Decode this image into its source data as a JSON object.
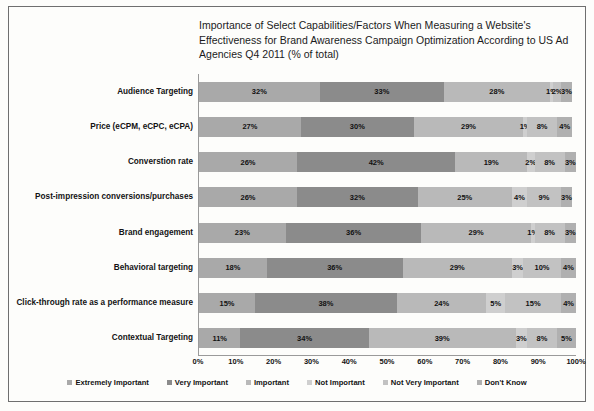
{
  "chart_data": {
    "type": "bar",
    "orientation": "horizontal",
    "stacked": true,
    "title": "Importance of Select Capabilities/Factors When Measuring a Website's Effectiveness for Brand Awareness Campaign Optimization According to US Ad Agencies Q4 2011 (% of total)",
    "xlabel": "",
    "ylabel": "",
    "xlim": [
      0,
      100
    ],
    "grid": false,
    "legend_position": "bottom",
    "xticks": [
      "0%",
      "10%",
      "20%",
      "30%",
      "40%",
      "50%",
      "60%",
      "70%",
      "80%",
      "90%",
      "100%"
    ],
    "categories": [
      "Audience Targeting",
      "Price (eCPM, eCPC, eCPA)",
      "Converstion rate",
      "Post-impression conversions/purchases",
      "Brand engagement",
      "Behavioral targeting",
      "Click-through rate as a performance measure",
      "Contextual Targeting"
    ],
    "series": [
      {
        "name": "Extremely Important",
        "color": "#a9a9a9",
        "values": [
          32,
          27,
          26,
          26,
          23,
          18,
          15,
          11
        ],
        "labels": [
          "32%",
          "27%",
          "26%",
          "26%",
          "23%",
          "18%",
          "15%",
          "11%"
        ]
      },
      {
        "name": "Very Important",
        "color": "#8b8b8b",
        "values": [
          33,
          30,
          42,
          32,
          36,
          36,
          38,
          34
        ],
        "labels": [
          "33%",
          "30%",
          "42%",
          "32%",
          "36%",
          "36%",
          "38%",
          "34%"
        ]
      },
      {
        "name": "Important",
        "color": "#b9b9b9",
        "values": [
          28,
          29,
          19,
          25,
          29,
          29,
          24,
          39
        ],
        "labels": [
          "28%",
          "29%",
          "19%",
          "25%",
          "29%",
          "29%",
          "24%",
          "39%"
        ]
      },
      {
        "name": "Not Important",
        "color": "#cfcfcf",
        "values": [
          1,
          1,
          2,
          4,
          1,
          3,
          5,
          3
        ],
        "labels": [
          "1%",
          "1%",
          "2%",
          "4%",
          "1%",
          "3%",
          "5%",
          "3%"
        ]
      },
      {
        "name": "Not Very Important",
        "color": "#c2c2c2",
        "values": [
          2,
          8,
          8,
          9,
          8,
          10,
          15,
          8
        ],
        "labels": [
          "2%",
          "8%",
          "8%",
          "9%",
          "8%",
          "10%",
          "15%",
          "8%"
        ]
      },
      {
        "name": "Don't Know",
        "color": "#b0b0b0",
        "values": [
          3,
          4,
          3,
          3,
          3,
          4,
          4,
          5
        ],
        "labels": [
          "3%",
          "4%",
          "3%",
          "3%",
          "3%",
          "4%",
          "4%",
          "5%"
        ]
      }
    ]
  }
}
